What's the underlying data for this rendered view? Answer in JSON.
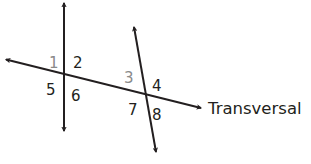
{
  "diagram": {
    "type": "geometry-transversal",
    "colors": {
      "line": "#231f20",
      "label_dark": "#231f20",
      "label_gray": "#8a8a8a",
      "background": "#ffffff"
    },
    "lines": [
      {
        "name": "left-line",
        "x1": 64,
        "y1": 3,
        "x2": 64,
        "y2": 131,
        "arrows": "both"
      },
      {
        "name": "right-line",
        "x1": 134,
        "y1": 27,
        "x2": 156,
        "y2": 152,
        "arrows": "both"
      },
      {
        "name": "transversal",
        "x1": 6,
        "y1": 59.5,
        "x2": 201,
        "y2": 108,
        "arrows": "both"
      }
    ],
    "transversal_label": {
      "text": "Transversal",
      "x": 208,
      "y": 114
    },
    "angles": [
      {
        "id": "1",
        "text": "1",
        "x": 49,
        "y": 68,
        "tone": "gray"
      },
      {
        "id": "2",
        "text": "2",
        "x": 73,
        "y": 68,
        "tone": "dark"
      },
      {
        "id": "3",
        "text": "3",
        "x": 124,
        "y": 83,
        "tone": "gray"
      },
      {
        "id": "4",
        "text": "4",
        "x": 152,
        "y": 91,
        "tone": "dark"
      },
      {
        "id": "5",
        "text": "5",
        "x": 46,
        "y": 95,
        "tone": "dark"
      },
      {
        "id": "6",
        "text": "6",
        "x": 71,
        "y": 101,
        "tone": "dark"
      },
      {
        "id": "7",
        "text": "7",
        "x": 128,
        "y": 115,
        "tone": "dark"
      },
      {
        "id": "8",
        "text": "8",
        "x": 152,
        "y": 120,
        "tone": "dark"
      }
    ]
  }
}
